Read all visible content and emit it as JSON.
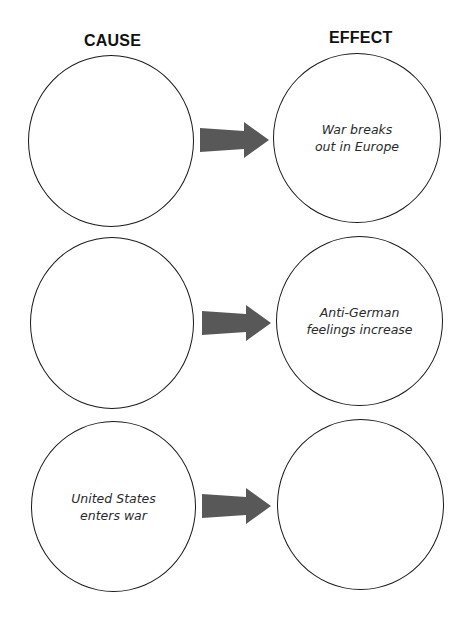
{
  "headings": {
    "cause": "CAUSE",
    "effect": "EFFECT"
  },
  "rows": [
    {
      "cause": "",
      "effect": "War breaks\nout in Europe"
    },
    {
      "cause": "",
      "effect": "Anti-German\nfeelings increase"
    },
    {
      "cause": "United States\nenters war",
      "effect": ""
    }
  ],
  "colors": {
    "arrow": "#585858",
    "outline": "#1a1a1a"
  },
  "icons": {
    "connector": "arrow-right-icon"
  }
}
